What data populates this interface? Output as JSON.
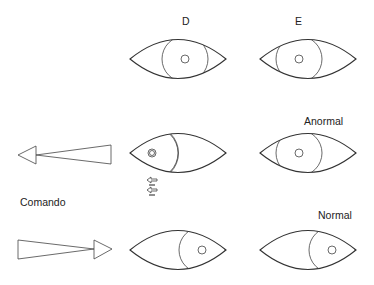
{
  "diagram": {
    "column_labels": {
      "right_eye": "D",
      "left_eye": "E"
    },
    "row_labels": {
      "abnormal": "Anormal",
      "normal": "Normal"
    },
    "command_label": "Comando",
    "rows": [
      {
        "name": "primary-gaze",
        "right_eye": "iris-centered",
        "left_eye": "iris-centered"
      },
      {
        "name": "command-left",
        "arrow": "left",
        "right_eye": "iris-left-with-double-limbus-and-motion-arrows",
        "left_eye": "iris-centered",
        "label": "Anormal"
      },
      {
        "name": "command-right",
        "arrow": "right",
        "right_eye": "iris-right",
        "left_eye": "iris-right",
        "label": "Normal"
      }
    ]
  }
}
